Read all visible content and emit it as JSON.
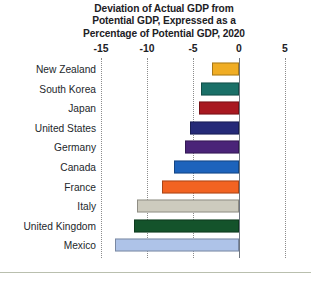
{
  "figure": {
    "title_lines": [
      "Deviation of Actual GDP from",
      "Potential GDP, Expressed as a",
      "Percentage of Potential GDP, 2020"
    ]
  },
  "axis": {
    "tick_labels": [
      "-15",
      "-10",
      "-5",
      "0",
      "5"
    ]
  },
  "chart_data": {
    "type": "bar",
    "orientation": "horizontal",
    "title": "Deviation of Actual GDP from Potential GDP, Expressed as a Percentage of Potential GDP, 2020",
    "xlabel": "",
    "ylabel": "",
    "xlim": [
      -15,
      5
    ],
    "xticks": [
      -15,
      -10,
      -5,
      0,
      5
    ],
    "grid": true,
    "legend": "none",
    "categories": [
      "New Zealand",
      "South Korea",
      "Japan",
      "United States",
      "Germany",
      "Canada",
      "France",
      "Italy",
      "United Kingdom",
      "Mexico"
    ],
    "values": [
      -2.9,
      -4.1,
      -4.4,
      -5.3,
      -5.9,
      -7.1,
      -8.4,
      -11.1,
      -11.4,
      -13.5
    ],
    "colors": [
      "#F0AD24",
      "#1A7068",
      "#A81820",
      "#252A78",
      "#4A2478",
      "#1D63BC",
      "#F26322",
      "#CDCBBE",
      "#14532B",
      "#AEC3E8"
    ]
  }
}
